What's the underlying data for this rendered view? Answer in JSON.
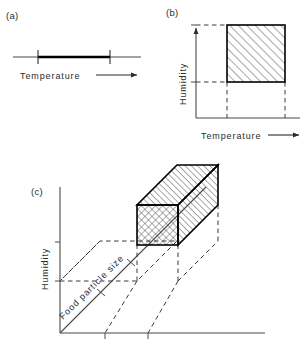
{
  "figure": {
    "background_color": "#ffffff",
    "ink_color": "#1a1a1a",
    "panels": [
      {
        "id": "a",
        "label": "(a)",
        "description": "One-dimensional temperature axis with a bold acceptable-range segment bounded by two tick marks",
        "axes": [
          {
            "name": "Temperature",
            "label": "Temperature",
            "orientation": "horizontal",
            "has_arrow": true
          }
        ],
        "region": {
          "type": "segment",
          "style": "bold-line",
          "bounds": [
            "lower-tick",
            "upper-tick"
          ]
        }
      },
      {
        "id": "b",
        "label": "(b)",
        "description": "Two-dimensional temperature-humidity plane with a diagonally hatched rectangular region projected onto both axes by dashed lines",
        "axes": [
          {
            "name": "Humidity",
            "label": "Humidity",
            "orientation": "vertical",
            "has_arrow": true
          },
          {
            "name": "Temperature",
            "label": "Temperature",
            "orientation": "horizontal",
            "has_arrow": true
          }
        ],
        "region": {
          "type": "rectangle",
          "fill": "diagonal-hatch",
          "border": "solid-thick",
          "projections": "dashed"
        }
      },
      {
        "id": "c",
        "label": "(c)",
        "description": "Three-dimensional space of humidity, food particle size and temperature containing a hatched rectangular box whose projections are shown with dashed lines",
        "axes": [
          {
            "name": "Humidity",
            "label": "Humidity",
            "orientation": "vertical",
            "has_arrow": false
          },
          {
            "name": "Food particle size",
            "label": "Food particle size",
            "orientation": "diagonal",
            "has_arrow": false
          },
          {
            "name": "Temperature",
            "label": "",
            "orientation": "horizontal",
            "has_arrow": false
          }
        ],
        "region": {
          "type": "box",
          "front_face_fill": "cross-hatch",
          "top_face_fill": "diagonal-hatch",
          "side_face_fill": "diagonal-hatch",
          "border": "solid-thick",
          "projections": "dashed"
        }
      }
    ]
  },
  "labels": {
    "panel_a": "(a)",
    "panel_b": "(b)",
    "panel_c": "(c)",
    "temperature_a": "Temperature",
    "humidity_b": "Humidity",
    "temperature_b": "Temperature",
    "humidity_c": "Humidity",
    "food_particle_size_c": "Food particle size"
  }
}
